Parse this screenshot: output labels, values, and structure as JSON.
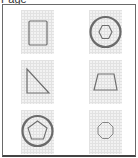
{
  "header": {
    "title": "Page"
  },
  "shapes": [
    {
      "name": "rectangle",
      "row": 1,
      "col": 1,
      "enclosed_in_circle": false
    },
    {
      "name": "hexagon",
      "row": 1,
      "col": 2,
      "enclosed_in_circle": true
    },
    {
      "name": "right-triangle",
      "row": 2,
      "col": 1,
      "enclosed_in_circle": false
    },
    {
      "name": "trapezoid",
      "row": 2,
      "col": 2,
      "enclosed_in_circle": false
    },
    {
      "name": "pentagon",
      "row": 3,
      "col": 1,
      "enclosed_in_circle": true
    },
    {
      "name": "octagon",
      "row": 3,
      "col": 2,
      "enclosed_in_circle": false
    }
  ],
  "colors": {
    "stroke": "#6e6e6e",
    "circle_stroke": "#6a6a6a",
    "tile_bg": "#f2f2f2",
    "grid": "#e2e2e2",
    "border": "#6a6a6a"
  }
}
